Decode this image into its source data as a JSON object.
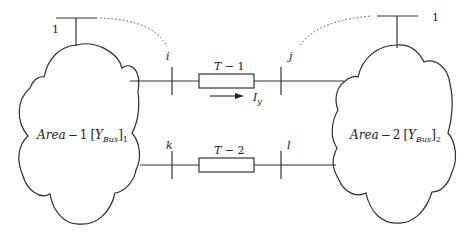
{
  "diagram": {
    "type": "two-area power system interconnection",
    "areas": [
      {
        "id": "area-1",
        "name": "Area",
        "dash": "−",
        "index": "1",
        "matrix": "Y",
        "matrix_sub": "Bus",
        "bracket_sub": "1",
        "reference_bus_label": "1"
      },
      {
        "id": "area-2",
        "name": "Area",
        "dash": "−",
        "index": "2",
        "matrix": "Y",
        "matrix_sub": "Bus",
        "bracket_sub": "2",
        "reference_bus_label": "1"
      }
    ],
    "buses": {
      "i": "i",
      "j": "j",
      "k": "k",
      "l": "l"
    },
    "tie_lines": [
      {
        "id": "T-1",
        "label_main": "T",
        "label_dash": " − ",
        "label_num": "1",
        "from": "i",
        "to": "j",
        "current_label": "I",
        "current_sub": "y"
      },
      {
        "id": "T-2",
        "label_main": "T",
        "label_dash": " − ",
        "label_num": "2",
        "from": "k",
        "to": "l"
      }
    ],
    "colors": {
      "line": "#333333",
      "background": "#ffffff",
      "text": "#222222"
    }
  }
}
